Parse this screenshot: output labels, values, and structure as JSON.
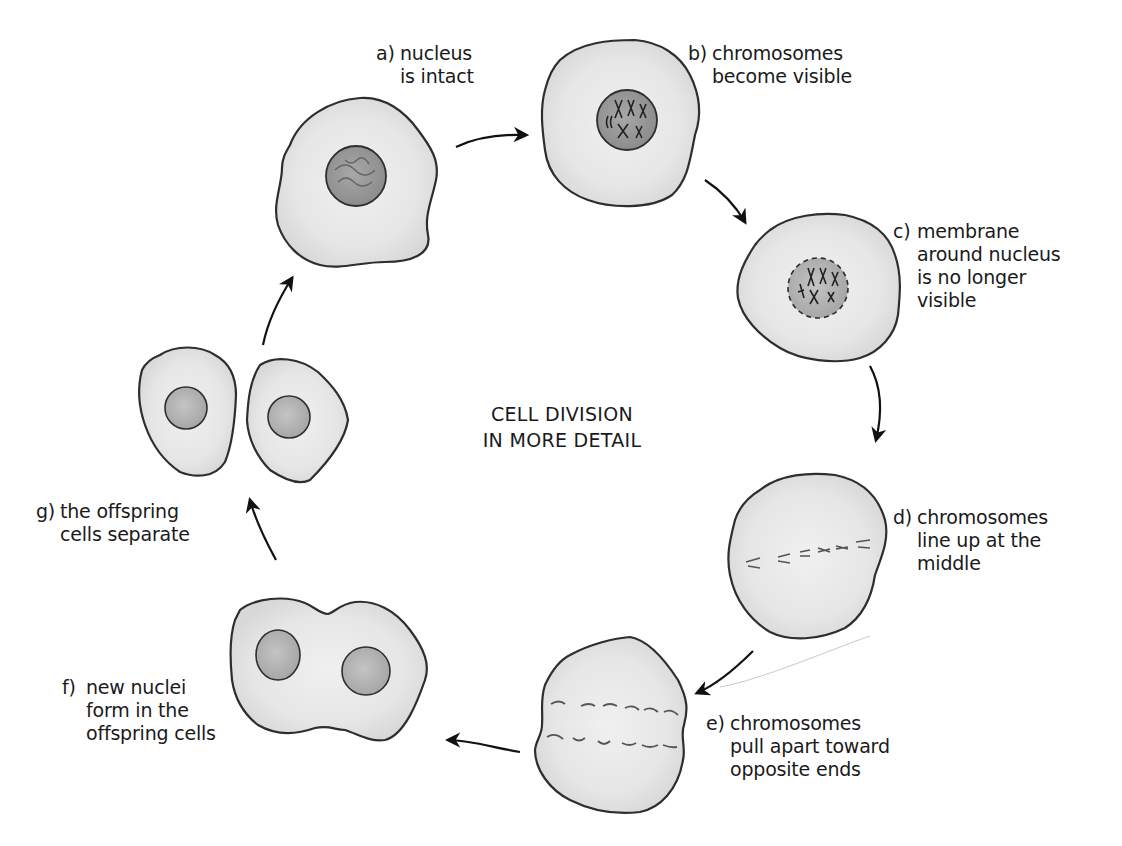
{
  "title": {
    "line1": "CELL DIVISION",
    "line2": "IN MORE DETAIL"
  },
  "stages": [
    {
      "marker": "a)",
      "text": "nucleus\nis intact"
    },
    {
      "marker": "b)",
      "text": "chromosomes\nbecome visible"
    },
    {
      "marker": "c)",
      "text": "membrane\naround nucleus\nis no longer\nvisible"
    },
    {
      "marker": "d)",
      "text": "chromosomes\nline up at the\nmiddle"
    },
    {
      "marker": "e)",
      "text": "chromosomes\npull apart toward\nopposite ends"
    },
    {
      "marker": "f)",
      "text": "new nuclei\nform in the\noffspring cells"
    },
    {
      "marker": "g)",
      "text": "the offspring\ncells separate"
    }
  ],
  "colors": {
    "cell_fill": "#e8e8e8",
    "cell_outline": "#2e2e2e",
    "nucleus_fill": "#9a9a9a",
    "nucleus_light": "#b5b5b5",
    "chromosome": "#3a3a3a",
    "chromosome_faded": "#6a6a6a",
    "arrow": "#111111",
    "text": "#1a1a1a"
  }
}
